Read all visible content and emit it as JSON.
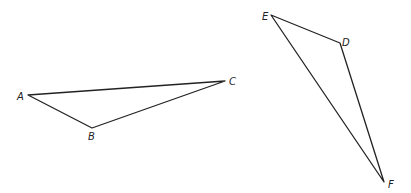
{
  "figure": {
    "stroke_color": "#222222",
    "background": "#ffffff"
  },
  "triangles": [
    {
      "name": "ABC",
      "vertices": [
        {
          "label": "A",
          "x": 28,
          "y": 95,
          "lx": 17,
          "ly": 100
        },
        {
          "label": "B",
          "x": 92,
          "y": 128,
          "lx": 88,
          "ly": 140
        },
        {
          "label": "C",
          "x": 225,
          "y": 81,
          "lx": 229,
          "ly": 85
        }
      ]
    },
    {
      "name": "DEF",
      "vertices": [
        {
          "label": "E",
          "x": 271,
          "y": 15,
          "lx": 262,
          "ly": 20
        },
        {
          "label": "D",
          "x": 340,
          "y": 43,
          "lx": 342,
          "ly": 46
        },
        {
          "label": "F",
          "x": 384,
          "y": 182,
          "lx": 388,
          "ly": 188
        }
      ]
    }
  ]
}
